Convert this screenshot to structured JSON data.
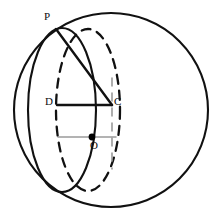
{
  "figure": {
    "type": "geometry-diagram",
    "canvas": {
      "width": 217,
      "height": 220,
      "background": "#ffffff"
    },
    "colors": {
      "stroke_dark": "#111111",
      "stroke_gray": "#9a9a9a",
      "point_fill": "#000000",
      "label_text": "#0d0d0d"
    },
    "labels": [
      {
        "id": "P",
        "text": "P",
        "x": 46,
        "y": 20
      },
      {
        "id": "D",
        "text": "D",
        "x": 47,
        "y": 105
      },
      {
        "id": "C",
        "text": "C",
        "x": 116,
        "y": 105
      },
      {
        "id": "O",
        "text": "O",
        "x": 92,
        "y": 149
      }
    ],
    "points": [
      {
        "id": "P",
        "label": "P",
        "x": 56,
        "y": 29,
        "marker": "none"
      },
      {
        "id": "D",
        "label": "D",
        "x": 57,
        "y": 105,
        "marker": "none"
      },
      {
        "id": "C",
        "label": "C",
        "x": 112,
        "y": 105,
        "marker": "none"
      },
      {
        "id": "O",
        "label": "O",
        "x": 92,
        "y": 137,
        "marker": "dot",
        "radius": 3.4
      }
    ],
    "shapes": {
      "outer_circle": {
        "name": "sphere-outline",
        "cx": 111,
        "cy": 110,
        "r": 97,
        "style": "solid",
        "stroke": "#111111",
        "width": 2.1
      },
      "solid_ellipse": {
        "name": "great-circle-edge-solid",
        "cx": 62,
        "cy": 110,
        "rx": 34,
        "ry": 82,
        "style": "solid",
        "stroke": "#111111",
        "width": 2.1
      },
      "dashed_ellipse": {
        "name": "cross-section-circle-dashed",
        "cx": 88,
        "cy": 110,
        "rx": 32,
        "ry": 81,
        "style": "dashed",
        "stroke": "#111111",
        "width": 2.3,
        "dash": "9 7"
      },
      "segment_DC": {
        "name": "segment-D-C",
        "x1": 57,
        "y1": 105,
        "x2": 112,
        "y2": 105,
        "style": "solid",
        "stroke": "#111111",
        "width": 2.4
      },
      "segment_PC": {
        "name": "segment-P-C",
        "x1": 56,
        "y1": 29,
        "x2": 112,
        "y2": 105,
        "style": "solid",
        "stroke": "#111111",
        "width": 2.4
      },
      "axis_vertical": {
        "name": "vertical-axis-through-C",
        "x1": 112,
        "y1": 78,
        "x2": 112,
        "y2": 169,
        "style": "dashed",
        "stroke": "#9a9a9a",
        "width": 1.6,
        "dash": "8 7"
      },
      "axis_horizontal": {
        "name": "horizontal-axis-through-O",
        "x1": 58,
        "y1": 137,
        "x2": 116,
        "y2": 137,
        "style": "solid",
        "stroke": "#9a9a9a",
        "width": 1.5
      }
    }
  }
}
